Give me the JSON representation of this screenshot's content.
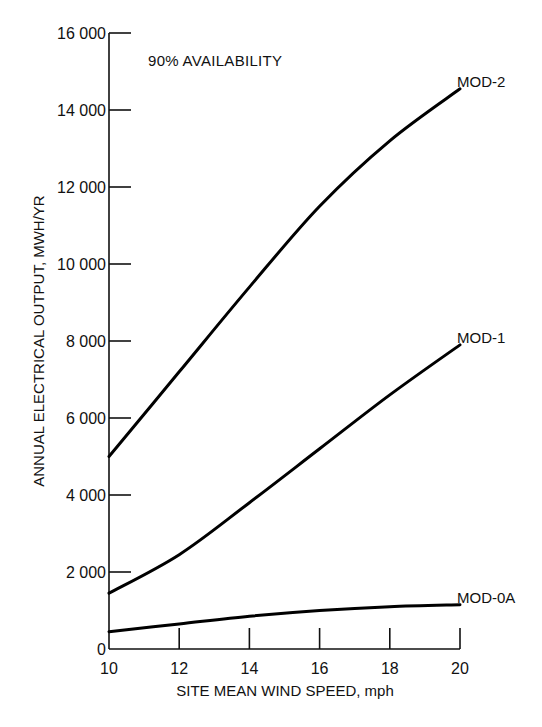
{
  "chart_data": {
    "type": "line",
    "title": "",
    "annotation": "90% AVAILABILITY",
    "xlabel": "SITE MEAN WIND SPEED, mph",
    "ylabel": "ANNUAL ELECTRICAL OUTPUT, MWH/YR",
    "xlim": [
      10,
      20
    ],
    "ylim": [
      0,
      16000
    ],
    "grid": false,
    "legend": "inline labels at right end of curves",
    "x_ticks": [
      10,
      12,
      14,
      16,
      18,
      20
    ],
    "x_tick_labels": [
      "10",
      "12",
      "14",
      "16",
      "18",
      "20"
    ],
    "y_ticks": [
      0,
      2000,
      4000,
      6000,
      8000,
      10000,
      12000,
      14000,
      16000
    ],
    "y_tick_labels": [
      "0",
      "2 000",
      "4 000",
      "6 000",
      "8 000",
      "10 000",
      "12 000",
      "14 000",
      "16 000"
    ],
    "x": [
      10,
      12,
      14,
      16,
      18,
      20
    ],
    "series": [
      {
        "name": "MOD-2",
        "values": [
          5000,
          7200,
          9400,
          11500,
          13200,
          14550
        ]
      },
      {
        "name": "MOD-1",
        "values": [
          1450,
          2450,
          3800,
          5200,
          6600,
          7900
        ]
      },
      {
        "name": "MOD-0A",
        "values": [
          450,
          650,
          850,
          1000,
          1100,
          1150
        ]
      }
    ]
  }
}
